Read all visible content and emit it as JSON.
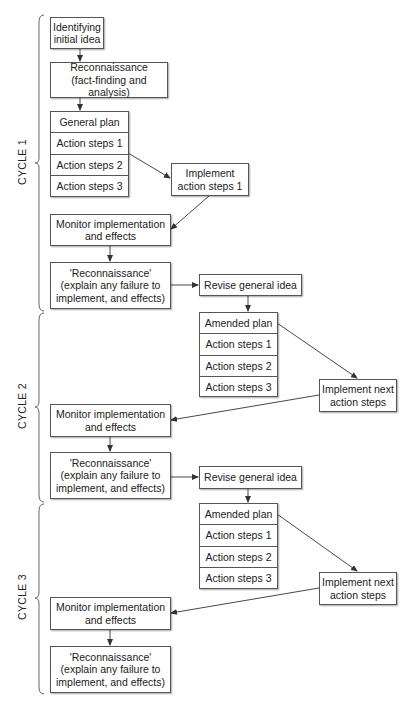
{
  "diagram": {
    "type": "action-research-cycle-flowchart",
    "colors": {
      "line": "#333333",
      "box_border": "#555555",
      "background": "#ffffff"
    },
    "cycles": [
      {
        "label": "CYCLE 1",
        "nodes": {
          "initial_idea": "Identifying initial idea",
          "initial_idea_l1": "Identifying",
          "initial_idea_l2": "initial idea",
          "recon_a_l1": "Reconnaissance",
          "recon_a_l2": "(fact-finding and analysis)",
          "plan_title": "General plan",
          "steps": [
            "Action steps 1",
            "Action steps 2",
            "Action steps 3"
          ],
          "implement_l1": "Implement",
          "implement_l2": "action steps 1",
          "monitor_l1": "Monitor implementation",
          "monitor_l2": "and effects",
          "recon_b_l1": "'Reconnaissance'",
          "recon_b_l2": "(explain any failure to",
          "recon_b_l3": "implement, and effects)",
          "revise": "Revise general idea"
        }
      },
      {
        "label": "CYCLE 2",
        "nodes": {
          "plan_title": "Amended plan",
          "steps": [
            "Action steps 1",
            "Action steps 2",
            "Action steps 3"
          ],
          "implement_l1": "Implement next",
          "implement_l2": "action steps",
          "monitor_l1": "Monitor implementation",
          "monitor_l2": "and effects",
          "recon_b_l1": "'Reconnaissance'",
          "recon_b_l2": "(explain any failure to",
          "recon_b_l3": "implement, and effects)",
          "revise": "Revise general idea"
        }
      },
      {
        "label": "CYCLE 3",
        "nodes": {
          "plan_title": "Amended plan",
          "steps": [
            "Action steps 1",
            "Action steps 2",
            "Action steps 3"
          ],
          "implement_l1": "Implement next",
          "implement_l2": "action steps",
          "monitor_l1": "Monitor implementation",
          "monitor_l2": "and effects",
          "recon_b_l1": "'Reconnaissance'",
          "recon_b_l2": "(explain any failure to",
          "recon_b_l3": "implement, and effects)"
        }
      }
    ]
  }
}
